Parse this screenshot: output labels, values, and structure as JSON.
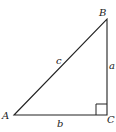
{
  "diagram": {
    "type": "right-triangle",
    "vertices": {
      "A": {
        "label": "A",
        "x": 14,
        "y": 115
      },
      "B": {
        "label": "B",
        "x": 107,
        "y": 19
      },
      "C": {
        "label": "C",
        "x": 107,
        "y": 115
      }
    },
    "sides": {
      "a": {
        "label": "a",
        "between": [
          "B",
          "C"
        ]
      },
      "b": {
        "label": "b",
        "between": [
          "A",
          "C"
        ]
      },
      "c": {
        "label": "c",
        "between": [
          "A",
          "B"
        ]
      }
    },
    "right_angle_at": "C",
    "line_color": "#222222",
    "background": "#ffffff"
  }
}
